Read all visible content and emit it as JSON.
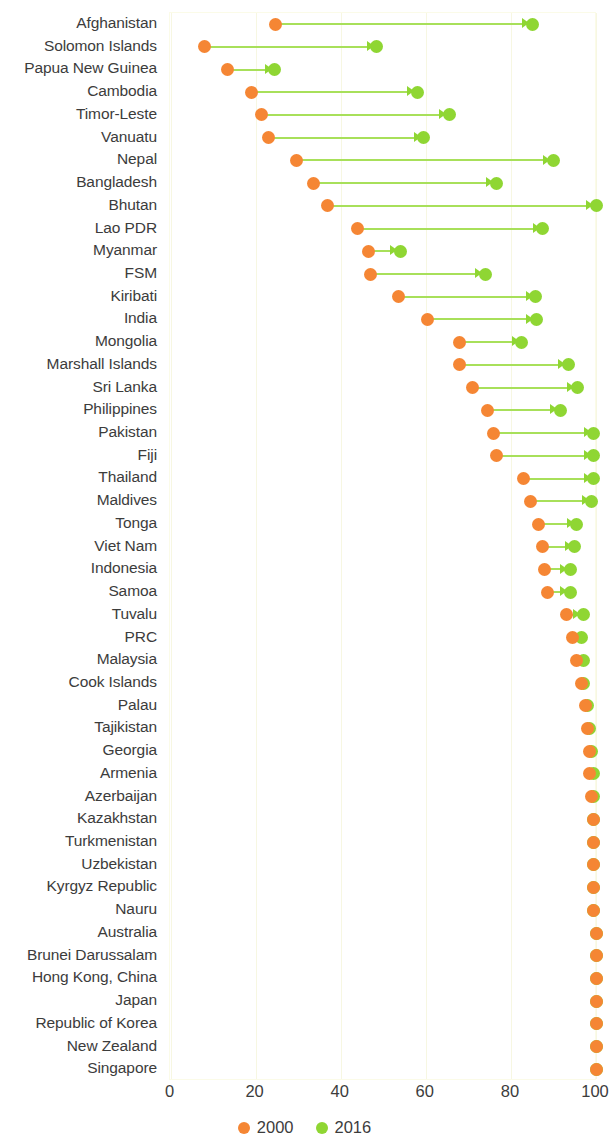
{
  "chart_data": {
    "type": "scatter",
    "subtype": "dumbbell-arrow",
    "title": "",
    "subtitle": "",
    "xlabel": "",
    "ylabel": "",
    "xlim": [
      0,
      100
    ],
    "xticks": [
      0,
      20,
      40,
      60,
      80,
      100
    ],
    "xtick_labels": [
      "0",
      "20",
      "40",
      "60",
      "80",
      "100"
    ],
    "grid": true,
    "grid_axis": "x",
    "legend_position": "bottom-center",
    "series": [
      {
        "name": "2000",
        "color": "#f58634",
        "marker": "circle"
      },
      {
        "name": "2016",
        "color": "#8fd633",
        "marker": "circle"
      }
    ],
    "categories": [
      "Afghanistan",
      "Solomon Islands",
      "Papua New Guinea",
      "Cambodia",
      "Timor-Leste",
      "Vanuatu",
      "Nepal",
      "Bangladesh",
      "Bhutan",
      "Lao PDR",
      "Myanmar",
      "FSM",
      "Kiribati",
      "India",
      "Mongolia",
      "Marshall Islands",
      "Sri Lanka",
      "Philippines",
      "Pakistan",
      "Fiji",
      "Thailand",
      "Maldives",
      "Tonga",
      "Viet Nam",
      "Indonesia",
      "Samoa",
      "Tuvalu",
      "PRC",
      "Malaysia",
      "Cook Islands",
      "Palau",
      "Tajikistan",
      "Georgia",
      "Armenia",
      "Azerbaijan",
      "Kazakhstan",
      "Turkmenistan",
      "Uzbekistan",
      "Kyrgyz Republic",
      "Nauru",
      "Australia",
      "Brunei Darussalam",
      "Hong Kong, China",
      "Japan",
      "Republic of Korea",
      "New Zealand",
      "Singapore"
    ],
    "values_2000": [
      24.6,
      8.0,
      13.5,
      19.0,
      21.5,
      23.0,
      29.5,
      33.5,
      37.0,
      44.0,
      46.5,
      47.0,
      53.5,
      60.5,
      68.0,
      68.0,
      71.0,
      74.5,
      76.0,
      76.5,
      83.0,
      84.5,
      86.5,
      87.5,
      88.0,
      88.5,
      93.0,
      94.5,
      95.5,
      96.5,
      97.5,
      98.0,
      98.5,
      98.5,
      99.0,
      99.5,
      99.5,
      99.5,
      99.5,
      99.5,
      100.0,
      100.0,
      100.0,
      100.0,
      100.0,
      100.0,
      100.0
    ],
    "values_2016": [
      85.0,
      48.5,
      24.5,
      58.0,
      65.5,
      59.5,
      90.0,
      76.5,
      100.0,
      87.5,
      54.0,
      74.0,
      85.8,
      86.0,
      82.6,
      93.5,
      95.6,
      91.6,
      99.5,
      99.5,
      99.5,
      99.0,
      95.5,
      95.0,
      94.0,
      94.0,
      97.0,
      96.5,
      97.0,
      97.0,
      98.0,
      98.5,
      99.0,
      99.5,
      99.5,
      99.5,
      99.5,
      99.5,
      99.5,
      99.5,
      100.0,
      100.0,
      100.0,
      100.0,
      100.0,
      100.0,
      100.0
    ]
  },
  "axis": {
    "ticks": [
      "0",
      "20",
      "40",
      "60",
      "80",
      "100"
    ]
  },
  "legend": {
    "items": [
      {
        "label": "2000",
        "color": "#f58634"
      },
      {
        "label": "2016",
        "color": "#8fd633"
      }
    ]
  },
  "colors": {
    "series_2000": "#f58634",
    "series_2016": "#8fd633",
    "connector": "#a8e05a",
    "grid": "#f7f7e2",
    "text": "#3c3c3c",
    "plot_border": "#fbfbe8"
  }
}
